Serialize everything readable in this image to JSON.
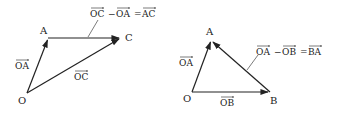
{
  "figures": [
    {
      "id": "left",
      "points": {
        "O": {
          "label": "O",
          "x": 27,
          "y": 93,
          "lx": 18,
          "ly": 104
        },
        "A": {
          "label": "A",
          "x": 48,
          "y": 38,
          "lx": 40,
          "ly": 34
        },
        "C": {
          "label": "C",
          "x": 121,
          "y": 38,
          "lx": 125,
          "ly": 41
        }
      },
      "vectors": [
        {
          "name": "OA",
          "from": "O",
          "to": "A",
          "label": "OA",
          "lx": 15,
          "ly": 67
        },
        {
          "name": "AC",
          "from": "A",
          "to": "C",
          "label": "",
          "lx": 0,
          "ly": 0
        },
        {
          "name": "OC",
          "from": "O",
          "to": "C",
          "label": "OC",
          "lx": 74,
          "ly": 78
        }
      ],
      "equation": {
        "parts": [
          "OC",
          "−",
          "OA",
          "=",
          "AC"
        ],
        "text": "OC − OA = AC",
        "x": 90,
        "y": 15
      }
    },
    {
      "id": "right",
      "points": {
        "O": {
          "label": "O",
          "x": 192,
          "y": 92,
          "lx": 183,
          "ly": 102
        },
        "A": {
          "label": "A",
          "x": 211,
          "y": 40,
          "lx": 206,
          "ly": 35
        },
        "B": {
          "label": "B",
          "x": 270,
          "y": 92,
          "lx": 270,
          "ly": 104
        }
      },
      "vectors": [
        {
          "name": "OA",
          "from": "O",
          "to": "A",
          "label": "OA",
          "lx": 179,
          "ly": 66
        },
        {
          "name": "OB",
          "from": "O",
          "to": "B",
          "label": "OB",
          "lx": 220,
          "ly": 104
        },
        {
          "name": "BA",
          "from": "B",
          "to": "A",
          "label": "",
          "lx": 0,
          "ly": 0
        }
      ],
      "equation": {
        "parts": [
          "OA",
          "−",
          "OB",
          "=",
          "BA"
        ],
        "text": "OA − OB = BA",
        "x": 256,
        "y": 55
      }
    }
  ],
  "labels": {
    "left_O": "O",
    "left_A": "A",
    "left_C": "C",
    "left_vec_OA": "OA",
    "left_vec_OC": "OC",
    "left_eq_1": "OC",
    "left_eq_minus": "−",
    "left_eq_2": "OA",
    "left_eq_eq": "=",
    "left_eq_3": "AC",
    "right_O": "O",
    "right_A": "A",
    "right_B": "B",
    "right_vec_OA": "OA",
    "right_vec_OB": "OB",
    "right_eq_1": "OA",
    "right_eq_minus": "−",
    "right_eq_2": "OB",
    "right_eq_eq": "=",
    "right_eq_3": "BA"
  },
  "colors": {
    "stroke": "#222222",
    "background": "#ffffff"
  }
}
